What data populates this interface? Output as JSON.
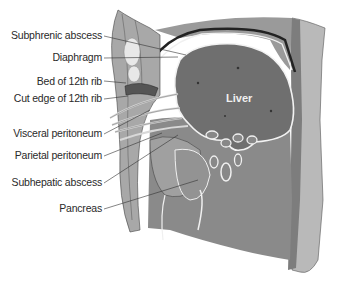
{
  "figure": {
    "organ_label": "Liver",
    "labels": [
      {
        "id": "subphrenic-abscess",
        "text": "Subphrenic abscess",
        "x": 103,
        "y": 35
      },
      {
        "id": "diaphragm",
        "text": "Diaphragm",
        "x": 103,
        "y": 57
      },
      {
        "id": "bed-of-12th-rib",
        "text": "Bed of 12th rib",
        "x": 103,
        "y": 81
      },
      {
        "id": "cut-edge-of-12th-rib",
        "text": "Cut edge of 12th rib",
        "x": 103,
        "y": 98
      },
      {
        "id": "visceral-peritoneum",
        "text": "Visceral peritoneum",
        "x": 103,
        "y": 133
      },
      {
        "id": "parietal-peritoneum",
        "text": "Parietal peritoneum",
        "x": 103,
        "y": 155
      },
      {
        "id": "subhepatic-abscess",
        "text": "Subhepatic abscess",
        "x": 103,
        "y": 182
      },
      {
        "id": "pancreas",
        "text": "Pancreas",
        "x": 103,
        "y": 208
      }
    ],
    "colors": {
      "tissue_dark": "#6e6e6e",
      "tissue_mid": "#8c8c8c",
      "tissue_light": "#b4b4b4",
      "wall": "#a0a0a0",
      "membrane": "#f2f2f2",
      "text": "#2a2a2a"
    }
  }
}
